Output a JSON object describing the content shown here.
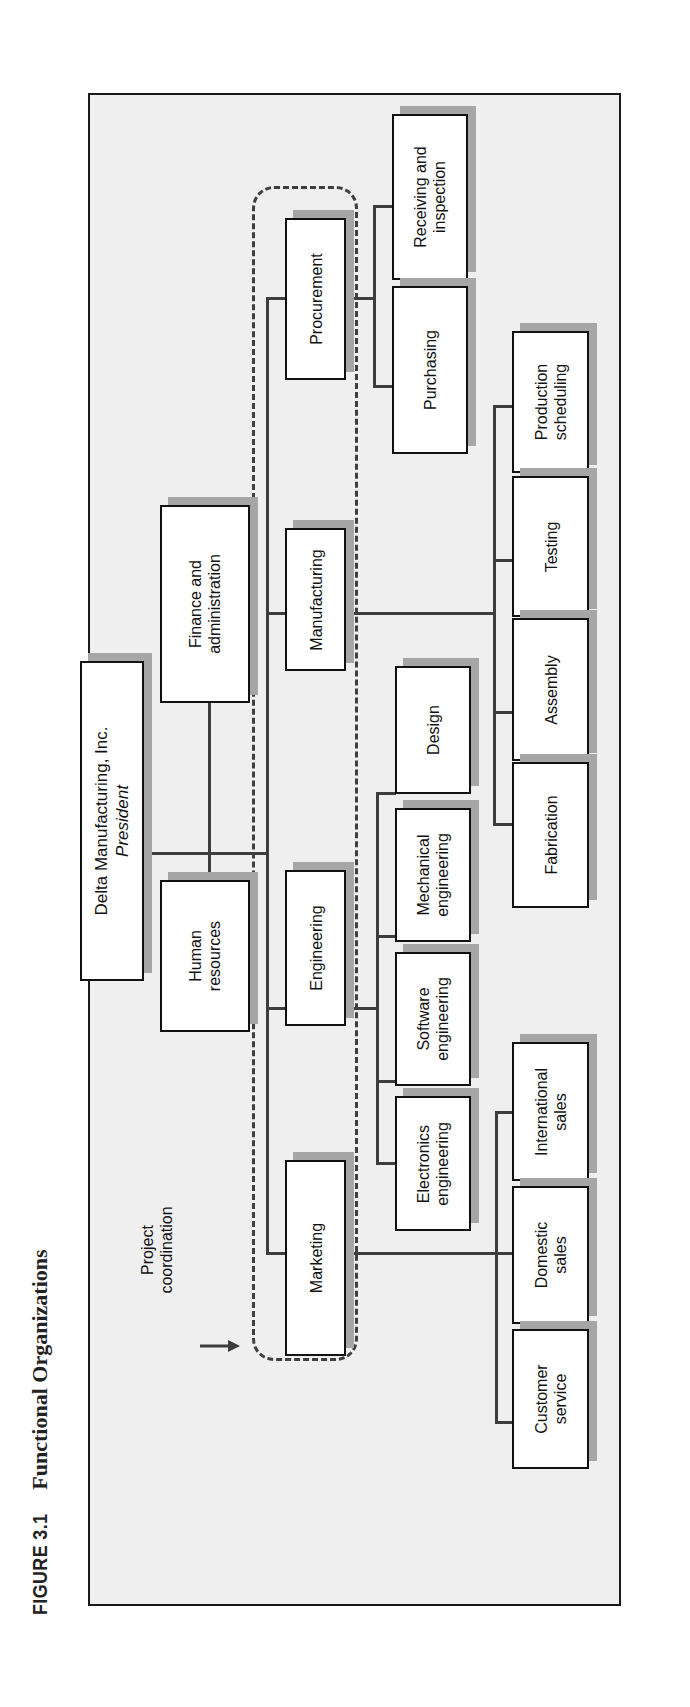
{
  "figure": {
    "number": "FIGURE 3.1",
    "title": "Functional Organizations"
  },
  "annotation": {
    "label_line1": "Project",
    "label_line2": "coordination",
    "arrow": "right-arrow"
  },
  "org": {
    "president": {
      "line1": "Delta Manufacturing, Inc.",
      "line2": "President"
    },
    "staff": [
      {
        "line1": "Finance and",
        "line2": "administration"
      },
      {
        "line1": "Human",
        "line2": "resources"
      }
    ],
    "departments": [
      {
        "label": "Procurement",
        "children": [
          {
            "line1": "Receiving and",
            "line2": "inspection"
          },
          {
            "line1": "Purchasing",
            "line2": ""
          }
        ]
      },
      {
        "label": "Manufacturing",
        "children": [
          {
            "line1": "Production",
            "line2": "scheduling"
          },
          {
            "line1": "Testing",
            "line2": ""
          },
          {
            "line1": "Assembly",
            "line2": ""
          },
          {
            "line1": "Fabrication",
            "line2": ""
          }
        ]
      },
      {
        "label": "Engineering",
        "children": [
          {
            "line1": "Design",
            "line2": ""
          },
          {
            "line1": "Mechanical",
            "line2": "engineering"
          },
          {
            "line1": "Software",
            "line2": "engineering"
          },
          {
            "line1": "Electronics",
            "line2": "engineering"
          }
        ]
      },
      {
        "label": "Marketing",
        "children": [
          {
            "line1": "International",
            "line2": "sales"
          },
          {
            "line1": "Domestic",
            "line2": "sales"
          },
          {
            "line1": "Customer",
            "line2": "service"
          }
        ]
      }
    ]
  },
  "colors": {
    "frame_bg": "#efefef",
    "box_bg": "#ffffff",
    "shadow": "#a6a6a6",
    "line": "#3d3d3d"
  }
}
